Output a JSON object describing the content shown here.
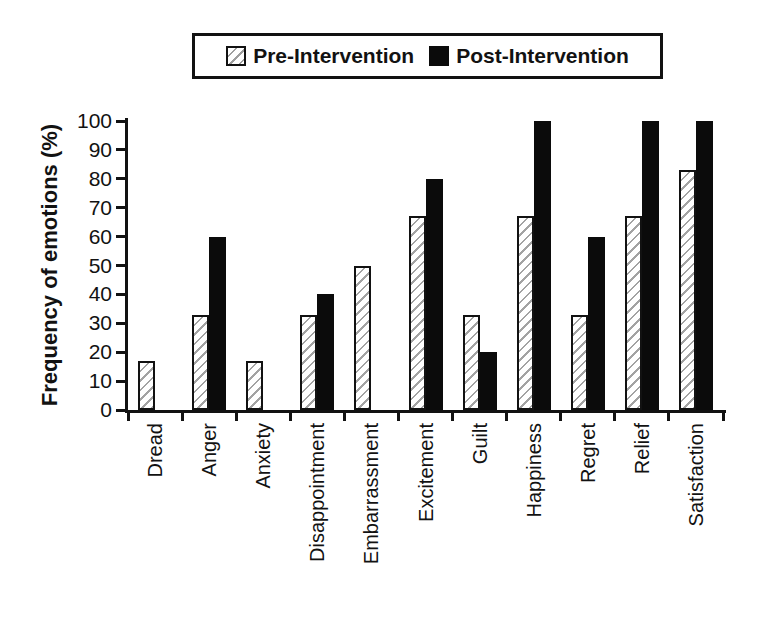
{
  "legend": {
    "items": [
      {
        "label": "Pre-Intervention",
        "swatch": "hatched"
      },
      {
        "label": "Post-Intervention",
        "swatch": "solid-black"
      }
    ]
  },
  "chart_data": {
    "type": "bar",
    "title": "",
    "xlabel": "",
    "ylabel": "Frequency of emotions (%)",
    "ylim": [
      0,
      100
    ],
    "ytick_step": 10,
    "grid": false,
    "legend_position": "top",
    "categories": [
      "Dread",
      "Anger",
      "Anxiety",
      "Disappointment",
      "Embarrassment",
      "Excitement",
      "Guilt",
      "Happiness",
      "Regret",
      "Relief",
      "Satisfaction"
    ],
    "series": [
      {
        "name": "Pre-Intervention",
        "style": "hatched",
        "values": [
          17,
          33,
          17,
          33,
          50,
          67,
          33,
          67,
          33,
          67,
          83
        ]
      },
      {
        "name": "Post-Intervention",
        "style": "solid-black",
        "values": [
          0,
          60,
          0,
          40,
          0,
          80,
          20,
          100,
          60,
          100,
          100
        ]
      }
    ]
  },
  "colors": {
    "background": "#ffffff",
    "axis": "#121212",
    "text": "#121212",
    "bar_solid": "#0b0b0b",
    "bar_outline": "#121212",
    "hatch_line": "#a3a3a3"
  }
}
